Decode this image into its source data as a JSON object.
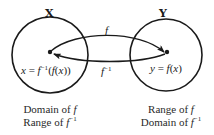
{
  "diagram": {
    "sets": [
      {
        "id": "X",
        "label": "X",
        "point_label_prefix": "x = f",
        "point_label_sup": "−1",
        "point_label_suffix": "(f(x))",
        "captions": [
          "Domain of f",
          "Range of f−1"
        ]
      },
      {
        "id": "Y",
        "label": "Y",
        "point_label": "y = f(x)",
        "captions": [
          "Range of f",
          "Domain of f−1"
        ]
      }
    ],
    "arrows": [
      {
        "from": "X",
        "to": "Y",
        "label": "f"
      },
      {
        "from": "Y",
        "to": "X",
        "label": "f",
        "label_sup": "−1"
      }
    ],
    "left_caption": {
      "line1_text": "Domain of ",
      "line1_fn": "f",
      "line2_text": "Range of ",
      "line2_fn": "f",
      "line2_sup": "−1"
    },
    "right_caption": {
      "line1_text": "Range of ",
      "line1_fn": "f",
      "line2_text": "Domain of ",
      "line2_fn": "f",
      "line2_sup": "−1"
    },
    "colors": {
      "stroke": "#1a1a1a",
      "text": "#2a2a2a"
    }
  }
}
